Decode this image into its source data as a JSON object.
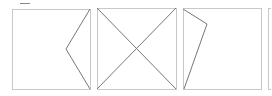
{
  "diagram": {
    "stroke_box": "#c8c8c8",
    "stroke_line": "#777777",
    "panels": [
      {
        "id": "panel-1",
        "x": 12,
        "y": 9,
        "w": 78,
        "h": 80,
        "polyline": [
          [
            90,
            9
          ],
          [
            66,
            49
          ],
          [
            90,
            89
          ]
        ]
      },
      {
        "id": "panel-2",
        "x": 97,
        "y": 8,
        "w": 79,
        "h": 81,
        "lines": [
          [
            [
              97,
              8
            ],
            [
              176,
              89
            ]
          ],
          [
            [
              176,
              8
            ],
            [
              97,
              89
            ]
          ]
        ]
      },
      {
        "id": "panel-3",
        "x": 183,
        "y": 8,
        "w": 78,
        "h": 81,
        "polyline": [
          [
            183,
            9
          ],
          [
            207,
            24
          ],
          [
            184,
            89
          ]
        ]
      },
      {
        "id": "panel-4-partial",
        "x": 268,
        "y": 8,
        "w": 10,
        "h": 81
      }
    ]
  }
}
